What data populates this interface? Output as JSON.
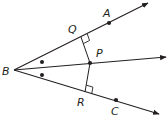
{
  "diagram": {
    "type": "geometry-angle-bisector",
    "colors": {
      "stroke": "#231f20",
      "background": "#ffffff"
    },
    "vertex": {
      "label": "B",
      "x": 14,
      "y": 70,
      "label_x": 2,
      "label_y": 75
    },
    "rays": [
      {
        "name": "ray-BA",
        "x2": 148,
        "y2": 3
      },
      {
        "name": "ray-BP",
        "x2": 166,
        "y2": 57
      },
      {
        "name": "ray-BC",
        "x2": 159,
        "y2": 114
      }
    ],
    "points": [
      {
        "label": "A",
        "x": 109,
        "y": 23,
        "label_x": 103,
        "label_y": 17
      },
      {
        "label": "P",
        "x": 90,
        "y": 63,
        "label_x": 96,
        "label_y": 57
      },
      {
        "label": "C",
        "x": 116,
        "y": 100,
        "label_x": 111,
        "label_y": 115
      }
    ],
    "feet": [
      {
        "label": "Q",
        "x": 81,
        "y": 37,
        "label_x": 68,
        "label_y": 33
      },
      {
        "label": "R",
        "x": 85,
        "y": 92,
        "label_x": 77,
        "label_y": 106
      }
    ],
    "angle_marks": [
      {
        "x": 42,
        "y": 62
      },
      {
        "x": 42,
        "y": 75
      }
    ]
  }
}
